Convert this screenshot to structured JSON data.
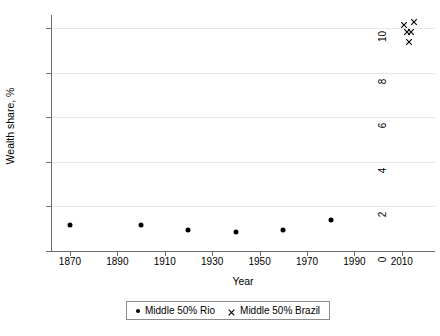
{
  "chart_data": {
    "type": "scatter",
    "title": "",
    "xlabel": "Year",
    "ylabel": "Wealth share, %",
    "xlim": [
      1862,
      2024
    ],
    "ylim": [
      0,
      10.6
    ],
    "xticks": [
      1870,
      1890,
      1910,
      1930,
      1950,
      1970,
      1990,
      2010
    ],
    "yticks": [
      0,
      2,
      4,
      6,
      8,
      10
    ],
    "xtick_labels": [
      "1870",
      "1890",
      "1910",
      "1930",
      "1950",
      "1970",
      "1990",
      "2010"
    ],
    "ytick_labels": [
      "0",
      "2",
      "4",
      "6",
      "8",
      "10"
    ],
    "grid": "horizontal",
    "legend_position": "bottom",
    "series": [
      {
        "name": "Middle 50% Rio",
        "marker": "circle",
        "color": "#000000",
        "points": [
          {
            "x": 1870,
            "y": 1.15
          },
          {
            "x": 1900,
            "y": 1.15
          },
          {
            "x": 1920,
            "y": 0.95
          },
          {
            "x": 1940,
            "y": 0.85
          },
          {
            "x": 1960,
            "y": 0.95
          },
          {
            "x": 1980,
            "y": 1.4
          }
        ]
      },
      {
        "name": "Middle 50% Brazil",
        "marker": "x",
        "color": "#000000",
        "points": [
          {
            "x": 2011,
            "y": 10.15
          },
          {
            "x": 2012,
            "y": 9.85
          },
          {
            "x": 2013,
            "y": 9.4
          },
          {
            "x": 2014,
            "y": 9.85
          },
          {
            "x": 2015,
            "y": 10.3
          }
        ]
      }
    ]
  },
  "legend": {
    "items": [
      {
        "label": "Middle 50% Rio",
        "marker": "circle"
      },
      {
        "label": "Middle 50% Brazil",
        "marker": "x"
      }
    ]
  },
  "colors": {
    "background": "#ffffff",
    "axis": "#6e6e6e",
    "gridline": "#e8e8e8",
    "marker": "#000000",
    "legend_border": "#8c8c8c"
  }
}
